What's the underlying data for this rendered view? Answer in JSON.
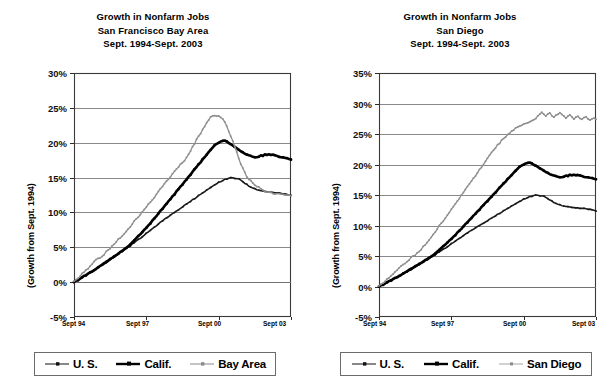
{
  "charts": [
    {
      "id": "bay-area",
      "title_lines": [
        "Growth in Nonfarm Jobs",
        "San Francisco Bay Area",
        "Sept. 1994-Sept. 2003"
      ],
      "ylabel": "(Growth from Sept. 1994)",
      "ytick_labels": [
        "30%",
        "25%",
        "20%",
        "15%",
        "10%",
        "5%",
        "0%",
        "-5%"
      ],
      "xtick_labels": [
        "Sept 94",
        "Sept 97",
        "Sept 00",
        "Sept 03"
      ],
      "legend": [
        {
          "label": "U. S.",
          "style": "thin-marker",
          "color": "#111111"
        },
        {
          "label": "Calif.",
          "style": "thick",
          "color": "#000000"
        },
        {
          "label": "Bay Area",
          "style": "gray-dotted",
          "color": "#8a8a8a"
        }
      ]
    },
    {
      "id": "san-diego",
      "title_lines": [
        "Growth in Nonfarm Jobs",
        "San Diego",
        "Sept. 1994-Sept. 2003"
      ],
      "ylabel": "(Growth from Sept. 1994)",
      "ytick_labels": [
        "35%",
        "30%",
        "25%",
        "20%",
        "15%",
        "10%",
        "5%",
        "0%",
        "-5%"
      ],
      "xtick_labels": [
        "Sept 94",
        "Sept 97",
        "Sept 00",
        "Sept 03"
      ],
      "legend": [
        {
          "label": "U. S.",
          "style": "thin-marker",
          "color": "#111111"
        },
        {
          "label": "Calif.",
          "style": "thick",
          "color": "#000000"
        },
        {
          "label": "San Diego",
          "style": "gray-dotted",
          "color": "#8a8a8a"
        }
      ]
    }
  ],
  "chart_data": [
    {
      "type": "line",
      "title": "Growth in Nonfarm Jobs — San Francisco Bay Area, Sept. 1994-Sept. 2003",
      "xlabel": "",
      "ylabel": "(Growth from Sept. 1994)",
      "ylim": [
        -5,
        30
      ],
      "ytick_interval": 5,
      "grid": true,
      "legend_position": "bottom",
      "x_start": "Sept 94",
      "x_end": "Sept 03",
      "x_tick_months": [
        0,
        36,
        72,
        108
      ],
      "x": [
        "Sept 94",
        "Sept 97",
        "Sept 00",
        "Sept 03"
      ],
      "n_points": 109,
      "series": [
        {
          "name": "U. S.",
          "values": [
            0.0,
            0.2,
            0.4,
            0.5,
            0.7,
            0.9,
            1.1,
            1.2,
            1.4,
            1.6,
            1.7,
            1.9,
            2.1,
            2.3,
            2.4,
            2.6,
            2.8,
            3.0,
            3.2,
            3.4,
            3.6,
            3.8,
            4.0,
            4.2,
            4.4,
            4.6,
            4.8,
            5.0,
            5.2,
            5.5,
            5.7,
            5.9,
            6.1,
            6.3,
            6.5,
            6.8,
            7.0,
            7.2,
            7.4,
            7.7,
            7.9,
            8.1,
            8.3,
            8.6,
            8.8,
            9.0,
            9.2,
            9.4,
            9.6,
            9.8,
            10.0,
            10.2,
            10.4,
            10.6,
            10.8,
            11.0,
            11.2,
            11.4,
            11.6,
            11.8,
            12.0,
            12.2,
            12.4,
            12.6,
            12.8,
            13.0,
            13.2,
            13.4,
            13.6,
            13.8,
            13.9,
            14.1,
            14.3,
            14.4,
            14.6,
            14.7,
            14.8,
            14.9,
            15.0,
            14.95,
            14.9,
            14.85,
            14.8,
            14.6,
            14.4,
            14.2,
            14.0,
            13.8,
            13.6,
            13.5,
            13.4,
            13.3,
            13.2,
            13.1,
            13.1,
            13.0,
            13.0,
            12.95,
            12.9,
            12.9,
            12.85,
            12.8,
            12.8,
            12.75,
            12.7,
            12.65,
            12.6,
            12.55,
            12.5
          ]
        },
        {
          "name": "Calif.",
          "values": [
            0.0,
            0.2,
            0.3,
            0.5,
            0.7,
            0.9,
            1.0,
            1.2,
            1.4,
            1.5,
            1.7,
            1.9,
            2.1,
            2.3,
            2.5,
            2.7,
            2.9,
            3.1,
            3.3,
            3.5,
            3.7,
            3.9,
            4.1,
            4.3,
            4.5,
            4.7,
            4.9,
            5.2,
            5.4,
            5.7,
            6.0,
            6.3,
            6.6,
            6.9,
            7.2,
            7.5,
            7.8,
            8.1,
            8.4,
            8.8,
            9.1,
            9.5,
            9.8,
            10.2,
            10.5,
            10.9,
            11.2,
            11.6,
            11.9,
            12.3,
            12.6,
            13.0,
            13.3,
            13.7,
            14.0,
            14.4,
            14.7,
            15.1,
            15.4,
            15.8,
            16.2,
            16.5,
            16.9,
            17.2,
            17.6,
            17.9,
            18.3,
            18.6,
            19.0,
            19.3,
            19.6,
            19.8,
            20.0,
            20.2,
            20.3,
            20.3,
            20.2,
            20.0,
            19.8,
            19.6,
            19.4,
            19.2,
            19.0,
            18.8,
            18.6,
            18.4,
            18.3,
            18.2,
            18.1,
            18.0,
            17.9,
            17.9,
            18.0,
            18.2,
            18.1,
            18.3,
            18.2,
            18.3,
            18.2,
            18.3,
            18.2,
            18.1,
            18.0,
            17.9,
            17.9,
            17.8,
            17.8,
            17.7,
            17.6
          ]
        },
        {
          "name": "Bay Area",
          "values": [
            0.0,
            0.3,
            0.6,
            0.9,
            1.2,
            1.5,
            1.8,
            2.0,
            2.3,
            2.6,
            2.9,
            3.2,
            3.3,
            3.5,
            3.7,
            4.0,
            4.3,
            4.6,
            4.9,
            5.2,
            5.5,
            5.8,
            6.1,
            6.4,
            6.7,
            7.0,
            7.3,
            7.7,
            8.0,
            8.4,
            8.7,
            9.1,
            9.4,
            9.8,
            10.1,
            10.5,
            10.8,
            11.2,
            11.5,
            11.9,
            12.2,
            12.6,
            13.0,
            13.4,
            13.7,
            14.1,
            14.5,
            14.8,
            15.2,
            15.6,
            15.9,
            16.3,
            16.6,
            17.0,
            17.1,
            17.4,
            17.9,
            18.4,
            18.9,
            19.4,
            19.9,
            20.4,
            20.9,
            21.4,
            21.9,
            22.4,
            22.9,
            23.3,
            23.7,
            23.9,
            24.0,
            23.9,
            23.8,
            23.7,
            23.5,
            23.0,
            22.4,
            21.7,
            21.0,
            20.2,
            19.4,
            18.6,
            17.8,
            17.0,
            16.3,
            15.7,
            15.2,
            14.8,
            14.5,
            14.3,
            14.0,
            13.8,
            13.6,
            13.4,
            13.2,
            13.0,
            12.9,
            13.0,
            12.9,
            12.8,
            12.7,
            12.7,
            12.6,
            12.6,
            12.6,
            12.5,
            12.5,
            12.5,
            12.5
          ]
        }
      ]
    },
    {
      "type": "line",
      "title": "Growth in Nonfarm Jobs — San Diego, Sept. 1994-Sept. 2003",
      "xlabel": "",
      "ylabel": "(Growth from Sept. 1994)",
      "ylim": [
        -5,
        35
      ],
      "ytick_interval": 5,
      "grid": true,
      "legend_position": "bottom",
      "x_start": "Sept 94",
      "x_end": "Sept 03",
      "x_tick_months": [
        0,
        36,
        72,
        108
      ],
      "x": [
        "Sept 94",
        "Sept 97",
        "Sept 00",
        "Sept 03"
      ],
      "n_points": 109,
      "series": [
        {
          "name": "U. S.",
          "values": [
            0.0,
            0.2,
            0.4,
            0.5,
            0.7,
            0.9,
            1.1,
            1.2,
            1.4,
            1.6,
            1.7,
            1.9,
            2.1,
            2.3,
            2.4,
            2.6,
            2.8,
            3.0,
            3.2,
            3.4,
            3.6,
            3.8,
            4.0,
            4.2,
            4.4,
            4.6,
            4.8,
            5.0,
            5.2,
            5.5,
            5.7,
            5.9,
            6.1,
            6.3,
            6.5,
            6.8,
            7.0,
            7.2,
            7.4,
            7.7,
            7.9,
            8.1,
            8.3,
            8.6,
            8.8,
            9.0,
            9.2,
            9.4,
            9.6,
            9.8,
            10.0,
            10.2,
            10.4,
            10.6,
            10.8,
            11.0,
            11.2,
            11.4,
            11.6,
            11.8,
            12.0,
            12.2,
            12.4,
            12.6,
            12.8,
            13.0,
            13.2,
            13.4,
            13.6,
            13.8,
            13.9,
            14.1,
            14.3,
            14.4,
            14.6,
            14.7,
            14.8,
            14.9,
            15.0,
            14.95,
            14.9,
            14.85,
            14.8,
            14.6,
            14.4,
            14.2,
            14.0,
            13.8,
            13.6,
            13.5,
            13.4,
            13.3,
            13.2,
            13.1,
            13.1,
            13.0,
            13.0,
            12.95,
            12.9,
            12.9,
            12.85,
            12.8,
            12.8,
            12.75,
            12.7,
            12.65,
            12.6,
            12.55,
            12.4
          ]
        },
        {
          "name": "Calif.",
          "values": [
            0.0,
            0.2,
            0.3,
            0.5,
            0.7,
            0.9,
            1.0,
            1.2,
            1.4,
            1.5,
            1.7,
            1.9,
            2.1,
            2.3,
            2.5,
            2.7,
            2.9,
            3.1,
            3.3,
            3.5,
            3.7,
            3.9,
            4.1,
            4.3,
            4.5,
            4.7,
            4.9,
            5.2,
            5.4,
            5.7,
            6.0,
            6.3,
            6.6,
            6.9,
            7.2,
            7.5,
            7.8,
            8.1,
            8.4,
            8.8,
            9.1,
            9.5,
            9.8,
            10.2,
            10.5,
            10.9,
            11.2,
            11.6,
            11.9,
            12.3,
            12.6,
            13.0,
            13.3,
            13.7,
            14.0,
            14.4,
            14.7,
            15.1,
            15.4,
            15.8,
            16.2,
            16.5,
            16.9,
            17.2,
            17.6,
            17.9,
            18.3,
            18.6,
            19.0,
            19.3,
            19.6,
            19.8,
            20.0,
            20.2,
            20.3,
            20.3,
            20.2,
            20.0,
            19.8,
            19.6,
            19.4,
            19.2,
            19.0,
            18.8,
            18.6,
            18.4,
            18.3,
            18.2,
            18.1,
            18.0,
            17.9,
            17.9,
            18.0,
            18.2,
            18.1,
            18.3,
            18.2,
            18.3,
            18.2,
            18.3,
            18.2,
            18.1,
            18.0,
            17.9,
            17.9,
            17.8,
            17.8,
            17.7,
            17.6
          ]
        },
        {
          "name": "San Diego",
          "values": [
            0.0,
            0.3,
            0.6,
            0.9,
            1.2,
            1.5,
            1.8,
            2.1,
            2.4,
            2.7,
            3.0,
            3.3,
            3.5,
            3.8,
            4.1,
            4.4,
            4.7,
            5.0,
            5.2,
            5.5,
            5.8,
            6.1,
            6.5,
            6.9,
            7.3,
            7.7,
            8.1,
            8.6,
            9.0,
            9.5,
            9.9,
            10.4,
            10.8,
            11.3,
            11.7,
            12.2,
            12.7,
            13.1,
            13.6,
            14.1,
            14.5,
            15.0,
            15.4,
            15.9,
            16.4,
            16.8,
            17.3,
            17.8,
            18.2,
            18.7,
            19.2,
            19.6,
            20.1,
            20.6,
            21.0,
            21.5,
            22.0,
            22.4,
            22.8,
            23.2,
            23.5,
            23.9,
            24.2,
            24.6,
            24.9,
            25.2,
            25.5,
            25.7,
            26.0,
            26.2,
            26.4,
            26.5,
            26.6,
            26.8,
            26.9,
            27.0,
            27.2,
            27.4,
            27.6,
            27.9,
            28.2,
            28.5,
            28.3,
            28.0,
            28.2,
            28.4,
            28.1,
            27.8,
            28.0,
            28.3,
            28.6,
            28.3,
            27.9,
            27.6,
            27.9,
            28.2,
            27.8,
            27.5,
            27.8,
            28.0,
            27.6,
            27.4,
            27.6,
            27.8,
            27.5,
            27.3,
            27.5,
            27.6,
            27.5
          ]
        }
      ]
    }
  ]
}
